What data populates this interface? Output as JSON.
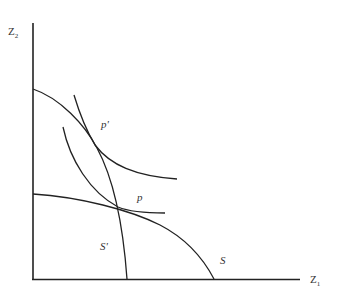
{
  "diagram": {
    "axes": {
      "y_label": "Z",
      "y_label_sub": "2",
      "x_label": "Z",
      "x_label_sub": "1"
    },
    "curves": [
      {
        "id": "S",
        "label": "S",
        "kind": "production-possibility frontier"
      },
      {
        "id": "S-prime",
        "label": "S'",
        "kind": "production-possibility frontier"
      },
      {
        "id": "indifference-upper",
        "label": "",
        "kind": "indifference curve"
      },
      {
        "id": "indifference-lower",
        "label": "",
        "kind": "indifference curve"
      }
    ],
    "points": [
      {
        "id": "p-prime",
        "label": "p'"
      },
      {
        "id": "p",
        "label": "p"
      }
    ],
    "colors": {
      "line": "#222222",
      "text": "#333333"
    }
  }
}
